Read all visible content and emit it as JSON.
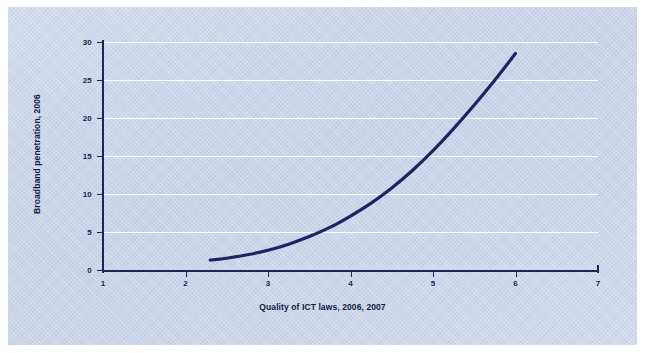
{
  "chart_data": {
    "type": "line",
    "title": "",
    "subtitle": "",
    "xlabel": "Quality of ICT laws, 2006, 2007",
    "ylabel": "Broadband penetration, 2006",
    "xlim": [
      1,
      7
    ],
    "ylim": [
      0,
      30
    ],
    "xticks": [
      "1",
      "2",
      "3",
      "4",
      "5",
      "6",
      "7"
    ],
    "yticks": [
      "0",
      "5",
      "10",
      "15",
      "20",
      "25",
      "30"
    ],
    "grid": "horizontal",
    "legend": "none",
    "series": [
      {
        "name": "Fitted trend",
        "color": "#1c2564",
        "x": [
          2.3,
          2.5,
          2.75,
          3.0,
          3.25,
          3.5,
          3.75,
          4.0,
          4.25,
          4.5,
          4.75,
          5.0,
          5.25,
          5.5,
          5.75,
          6.0
        ],
        "values": [
          1.3,
          1.55,
          2.0,
          2.6,
          3.4,
          4.4,
          5.6,
          7.1,
          8.8,
          10.8,
          13.1,
          15.7,
          18.6,
          21.7,
          25.0,
          28.5
        ]
      }
    ],
    "annotations": []
  },
  "figure": {
    "panel_color": "#ccd7ea",
    "axis_color": "#20254f",
    "gridline_color": "#ffffff",
    "curve_color": "#1c2564",
    "background_color": "#ffffff"
  }
}
